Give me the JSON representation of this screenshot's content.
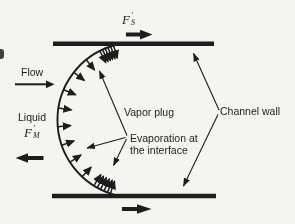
{
  "labels": {
    "flow": "Flow",
    "liquid": "Liquid",
    "vapor_plug": "Vapor plug",
    "evaporation_line1": "Evaporation at",
    "evaporation_line2": "the interface",
    "channel_wall": "Channel wall",
    "fs": {
      "base": "F",
      "prime": "′",
      "sub": "S"
    },
    "fm": {
      "base": "F",
      "prime": "′",
      "sub": "M"
    }
  },
  "colors": {
    "ink": "#1d1d1d",
    "text": "#222222",
    "background": "#f4f4f1"
  }
}
